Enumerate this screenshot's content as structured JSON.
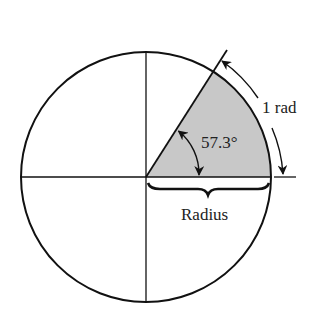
{
  "diagram": {
    "type": "radian-definition",
    "labels": {
      "arc_length": "1 rad",
      "angle": "57.3°",
      "radius": "Radius"
    },
    "geometry": {
      "center": [
        146,
        177
      ],
      "radius": 125,
      "sector_angle_deg": 57.3
    },
    "colors": {
      "stroke": "#111111",
      "sector_fill": "#c8c8c8",
      "background": "#ffffff"
    }
  }
}
